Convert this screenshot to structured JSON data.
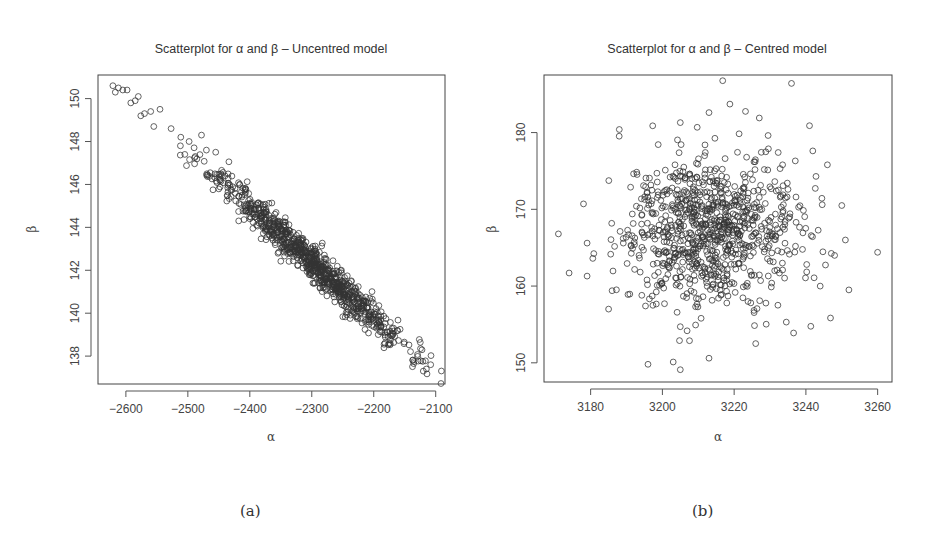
{
  "figure": {
    "captions": [
      "(a)",
      "(b)"
    ]
  },
  "chart_data": [
    {
      "type": "scatter",
      "title": "Scatterplot for α and β – Uncentred model",
      "xlabel": "α",
      "ylabel": "β",
      "xlim": [
        -2645,
        -2085
      ],
      "ylim": [
        136.7,
        151.1
      ],
      "xticks": [
        -2600,
        -2500,
        -2400,
        -2300,
        -2200,
        -2100
      ],
      "yticks": [
        138,
        140,
        142,
        144,
        146,
        148,
        150
      ],
      "grid": false,
      "marker": "open-circle",
      "description": "Strong negative linear correlation; points lie along a narrow band from (-2620, 150.5) to (-2110, 137.5).",
      "distribution": {
        "kind": "correlated-band",
        "n": 900,
        "x_mean": -2300,
        "x_sd": 75,
        "slope": -0.0257,
        "intercept_at_mean": 142.4,
        "residual_sd": 0.42,
        "seed": 11
      },
      "points": [
        [
          -2621,
          150.6
        ],
        [
          -2617,
          150.3
        ],
        [
          -2612,
          150.5
        ],
        [
          -2605,
          150.4
        ],
        [
          -2598,
          150.4
        ],
        [
          -2592,
          149.8
        ],
        [
          -2585,
          149.9
        ],
        [
          -2580,
          150.1
        ],
        [
          -2576,
          149.2
        ],
        [
          -2570,
          149.3
        ],
        [
          -2560,
          149.4
        ],
        [
          -2555,
          148.7
        ],
        [
          -2545,
          149.5
        ],
        [
          -2527,
          148.6
        ],
        [
          -2512,
          147.8
        ],
        [
          -2505,
          147.4
        ],
        [
          -2498,
          148.0
        ],
        [
          -2488,
          147.3
        ],
        [
          -2478,
          148.3
        ],
        [
          -2470,
          147.6
        ],
        [
          -2455,
          147.5
        ],
        [
          -2440,
          146.4
        ],
        [
          -2418,
          144.3
        ],
        [
          -2230,
          141.0
        ],
        [
          -2120,
          137.3
        ],
        [
          -2108,
          137.6
        ],
        [
          -2115,
          137.4
        ]
      ]
    },
    {
      "type": "scatter",
      "title": "Scatterplot for α and β – Centred model",
      "xlabel": "α",
      "ylabel": "β",
      "xlim": [
        3167,
        3264
      ],
      "ylim": [
        147.5,
        187.5
      ],
      "xticks": [
        3180,
        3200,
        3220,
        3240,
        3260
      ],
      "yticks": [
        150,
        160,
        170,
        180
      ],
      "grid": false,
      "marker": "open-circle",
      "description": "No visible correlation; roughly circular cloud centred near (3213, 167).",
      "distribution": {
        "kind": "bivariate-normal",
        "n": 900,
        "x_mean": 3213,
        "x_sd": 12,
        "y_mean": 167.3,
        "y_sd": 4.8,
        "seed": 29
      },
      "points": [
        [
          3171,
          166.8
        ],
        [
          3174,
          161.7
        ],
        [
          3178,
          170.7
        ],
        [
          3179,
          165.6
        ],
        [
          3179,
          161.3
        ],
        [
          3185,
          157.0
        ],
        [
          3188,
          180.4
        ],
        [
          3196,
          149.8
        ],
        [
          3205,
          181.3
        ],
        [
          3213,
          182.6
        ],
        [
          3227,
          181.9
        ],
        [
          3236,
          186.4
        ],
        [
          3241,
          180.9
        ],
        [
          3246,
          175.8
        ],
        [
          3251,
          166.0
        ],
        [
          3252,
          159.5
        ],
        [
          3260,
          164.4
        ],
        [
          3203,
          150.1
        ],
        [
          3205,
          149.1
        ],
        [
          3213,
          150.6
        ],
        [
          3226,
          152.5
        ],
        [
          3244,
          160.0
        ],
        [
          3248,
          164.0
        ],
        [
          3250,
          170.5
        ]
      ]
    }
  ]
}
